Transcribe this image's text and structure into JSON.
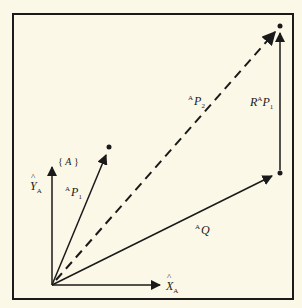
{
  "diagram": {
    "frame": {
      "label_open": "{",
      "label_name": "A",
      "label_close": "}"
    },
    "axes": {
      "x": {
        "base": "X",
        "sub": "A"
      },
      "y": {
        "base": "Y",
        "sub": "A"
      }
    },
    "vectors": {
      "p1": {
        "pre": "A",
        "base": "P",
        "sub": "1"
      },
      "p2": {
        "pre": "A",
        "base": "P",
        "sub": "2"
      },
      "q": {
        "pre": "A",
        "base": "Q"
      },
      "rp1": {
        "r": "R",
        "sup": "A",
        "base": "P",
        "sub": "1"
      }
    },
    "colors": {
      "background": "#fcf8e8",
      "ink": "#1a1a1a"
    }
  }
}
